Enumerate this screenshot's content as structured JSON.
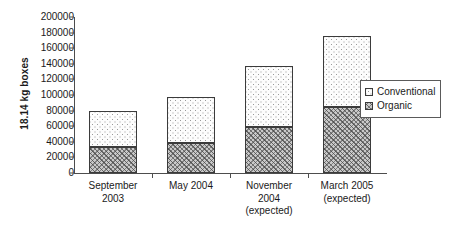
{
  "chart_data": {
    "type": "bar",
    "subtype": "stacked-vertical",
    "title": "",
    "xlabel": "",
    "ylabel": "18.14 kg boxes",
    "ylim": [
      0,
      200000
    ],
    "ytick_step": 20000,
    "yticks": [
      "200000",
      "180000",
      "160000",
      "140000",
      "120000",
      "100000",
      "80000",
      "60000",
      "40000",
      "20000",
      "0"
    ],
    "ytick_values": [
      200000,
      180000,
      160000,
      140000,
      120000,
      100000,
      80000,
      60000,
      40000,
      20000,
      0
    ],
    "grid": false,
    "legend_position": "right",
    "categories": [
      "September 2003",
      "May 2004",
      "November 2004 (expected)",
      "March 2005 (expected)"
    ],
    "category_lines": [
      [
        "September",
        "2003"
      ],
      [
        "May 2004"
      ],
      [
        "November",
        "2004",
        "(expected)"
      ],
      [
        "March 2005",
        "(expected)"
      ]
    ],
    "series": [
      {
        "name": "Organic",
        "values": [
          33000,
          38000,
          59000,
          84000
        ],
        "pattern": "dense-crosshatch"
      },
      {
        "name": "Conventional",
        "values": [
          47000,
          60000,
          78000,
          92000
        ],
        "pattern": "sparse-dots"
      }
    ],
    "stack_order": [
      "Organic",
      "Conventional"
    ],
    "totals": [
      80000,
      98000,
      137000,
      176000
    ]
  },
  "legend": {
    "items": [
      {
        "label": "Conventional",
        "swatch": "sparse-dots"
      },
      {
        "label": "Organic",
        "swatch": "dense-crosshatch"
      }
    ]
  },
  "colors": {
    "axis": "#4d4d4d",
    "bar_outline": "#3b3b3b",
    "conventional_fill": "#fdfdfd",
    "organic_fill": "#c9c9c9",
    "background": "#ffffff",
    "text": "#1a1a1a"
  }
}
